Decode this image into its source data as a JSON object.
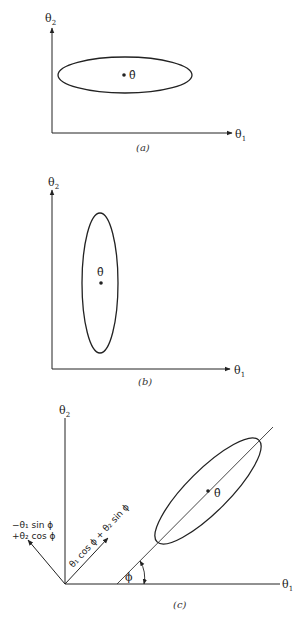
{
  "figure": {
    "panels": [
      {
        "id": "a",
        "caption": "(a)",
        "x_axis_label": "θ",
        "x_axis_sub": "1",
        "y_axis_label": "θ",
        "y_axis_sub": "2",
        "estimate_label": "θ̂",
        "ellipse": {
          "orientation": "horizontal"
        }
      },
      {
        "id": "b",
        "caption": "(b)",
        "x_axis_label": "θ",
        "x_axis_sub": "1",
        "y_axis_label": "θ",
        "y_axis_sub": "2",
        "estimate_label": "θ̂",
        "ellipse": {
          "orientation": "vertical"
        }
      },
      {
        "id": "c",
        "caption": "(c)",
        "x_axis_label": "θ",
        "x_axis_sub": "1",
        "y_axis_label": "θ",
        "y_axis_sub": "2",
        "estimate_label": "θ̂",
        "angle_label": "ϕ",
        "rotated_axis_1": "θ₁ cos ϕ + θ₂ sin ϕ",
        "rotated_axis_2_line1": "−θ₁ sin ϕ",
        "rotated_axis_2_line2": "+θ₂ cos ϕ",
        "ellipse": {
          "orientation": "tilted"
        }
      }
    ]
  }
}
